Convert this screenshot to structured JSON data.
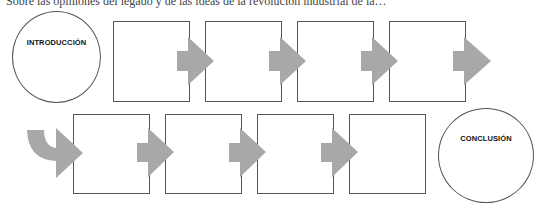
{
  "diagram": {
    "top_text": "Sobre las opiniones del legado y de las ideas de la revolución industrial de la…",
    "start_node": {
      "label": "INTRODUCCIÓN"
    },
    "end_node": {
      "label": "CONCLUSIÓN"
    },
    "top_row_steps": [
      {
        "label": ""
      },
      {
        "label": ""
      },
      {
        "label": ""
      },
      {
        "label": ""
      }
    ],
    "bottom_row_steps": [
      {
        "label": ""
      },
      {
        "label": ""
      },
      {
        "label": ""
      },
      {
        "label": ""
      }
    ],
    "colors": {
      "arrow": "#a8a8a8",
      "border": "#555555",
      "background": "#ffffff"
    }
  }
}
